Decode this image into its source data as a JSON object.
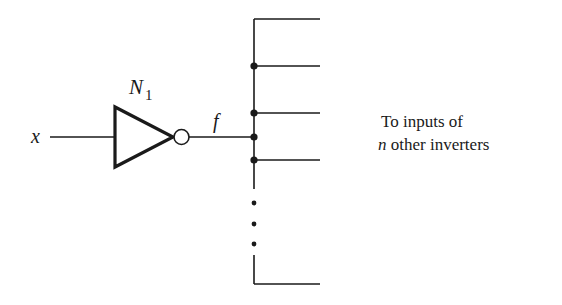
{
  "diagram": {
    "type": "logic-circuit-fanout",
    "input_label": "x",
    "gate": {
      "name": "N",
      "subscript": "1",
      "kind": "inverter"
    },
    "output_label": "f",
    "fanout_text": {
      "line1": "To inputs of",
      "line2_var": "n",
      "line2_rest": " other inverters"
    },
    "branches_y": [
      19,
      66,
      113,
      160,
      284
    ],
    "junction_dots_y": [
      66,
      113,
      137,
      160
    ],
    "ellipsis_dots_y": [
      203,
      224,
      244
    ],
    "colors": {
      "ink": "#1a1a1a",
      "background": "#ffffff"
    }
  }
}
